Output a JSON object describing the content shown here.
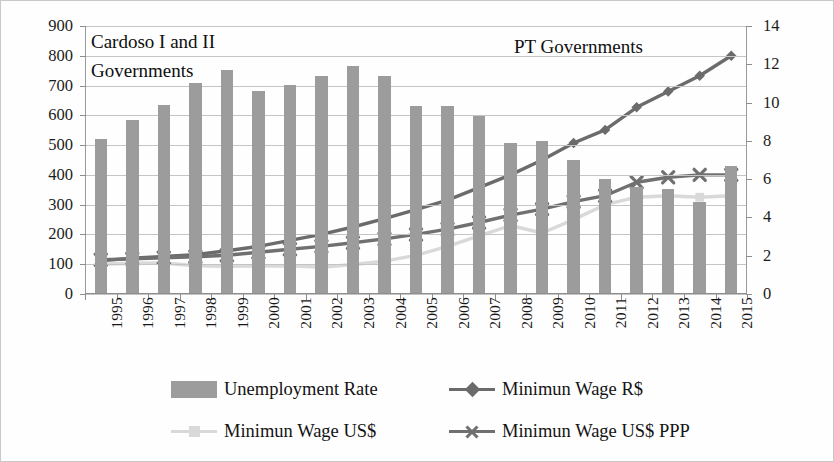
{
  "annotations": {
    "cardoso_line1": "Cardoso I and II",
    "cardoso_line2": "Governments",
    "pt": "PT Governments"
  },
  "legend": {
    "items": [
      {
        "label": "Unemployment Rate",
        "marker": "bar-swatch",
        "color": "#9c9c9c"
      },
      {
        "label": "Minimun Wage R$",
        "marker": "diamond-line",
        "color": "#6b6b6b"
      },
      {
        "label": "Minimun Wage US$",
        "marker": "square-line",
        "color": "#d9d9d9"
      },
      {
        "label": "Minimun Wage US$ PPP",
        "marker": "cross-line",
        "color": "#707070"
      }
    ]
  },
  "colors": {
    "bar": "#9c9c9c",
    "wage_brl": "#6b6b6b",
    "wage_usd": "#d9d9d9",
    "wage_ppp": "#707070",
    "grid": "#c4c4c4",
    "axis": "#8e8e8e",
    "text": "#141414"
  },
  "chart_data": {
    "type": "bar",
    "title": "",
    "xlabel": "",
    "ylabel": "",
    "grid": true,
    "legend_position": "bottom",
    "categories": [
      "1995",
      "1996",
      "1997",
      "1998",
      "1999",
      "2000",
      "2001",
      "2002",
      "2003",
      "2004",
      "2005",
      "2006",
      "2007",
      "2008",
      "2009",
      "2010",
      "2011",
      "2012",
      "2013",
      "2014",
      "2015"
    ],
    "left_axis": {
      "label": "",
      "ylim": [
        0,
        900
      ],
      "ticks": [
        0,
        100,
        200,
        300,
        400,
        500,
        600,
        700,
        800,
        900
      ],
      "tick_labels": [
        "0",
        "100",
        "200",
        "300",
        "400",
        "500",
        "600",
        "700",
        "800",
        "900"
      ]
    },
    "right_axis": {
      "label": "",
      "ylim": [
        0,
        14
      ],
      "ticks": [
        0,
        2,
        4,
        6,
        8,
        10,
        12,
        14
      ],
      "tick_labels": [
        "0",
        "2",
        "4",
        "6",
        "8",
        "10",
        "12",
        "14"
      ]
    },
    "series": [
      {
        "name": "Unemployment Rate",
        "type": "bar",
        "axis": "right",
        "color": "#9c9c9c",
        "values": [
          8.1,
          9.1,
          9.9,
          11.0,
          11.7,
          10.6,
          10.9,
          11.4,
          11.9,
          11.4,
          9.8,
          9.8,
          9.3,
          7.9,
          8.0,
          7.0,
          6.0,
          5.6,
          5.5,
          4.8,
          6.7
        ]
      },
      {
        "name": "Minimun Wage R$",
        "type": "line",
        "axis": "left",
        "color": "#6b6b6b",
        "marker": "diamond",
        "values": [
          112,
          120,
          126,
          132,
          145,
          160,
          180,
          200,
          225,
          253,
          283,
          315,
          357,
          400,
          450,
          507,
          551,
          627,
          680,
          733,
          800
        ]
      },
      {
        "name": "Minimun Wage US$",
        "type": "line",
        "axis": "left",
        "color": "#d9d9d9",
        "marker": "square",
        "values": [
          100,
          103,
          104,
          95,
          93,
          94,
          95,
          90,
          99,
          110,
          130,
          160,
          195,
          230,
          205,
          250,
          300,
          325,
          330,
          325,
          330
        ]
      },
      {
        "name": "Minimun Wage US$ PPP",
        "type": "line",
        "axis": "left",
        "color": "#707070",
        "marker": "cross",
        "values": [
          115,
          118,
          122,
          125,
          130,
          140,
          150,
          160,
          172,
          185,
          200,
          218,
          240,
          265,
          285,
          310,
          330,
          375,
          392,
          400,
          400
        ]
      }
    ]
  }
}
